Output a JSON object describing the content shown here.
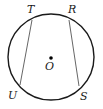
{
  "diagram": {
    "type": "circle-with-chords",
    "circle": {
      "cx": 51,
      "cy": 57,
      "r": 43,
      "stroke": "#1a1a1a"
    },
    "center": {
      "label": "O",
      "x": 51,
      "y": 58
    },
    "points": [
      {
        "label": "T",
        "x": 32,
        "y": 20,
        "lx": 27,
        "ly": 12
      },
      {
        "label": "R",
        "x": 69,
        "y": 20,
        "lx": 69,
        "ly": 12
      },
      {
        "label": "U",
        "x": 20,
        "y": 85,
        "lx": 8,
        "ly": 98
      },
      {
        "label": "S",
        "x": 79,
        "y": 86,
        "lx": 80,
        "ly": 99
      }
    ],
    "chords": [
      {
        "from": "T",
        "to": "U"
      },
      {
        "from": "R",
        "to": "S"
      }
    ],
    "chord_color": "#555555"
  }
}
